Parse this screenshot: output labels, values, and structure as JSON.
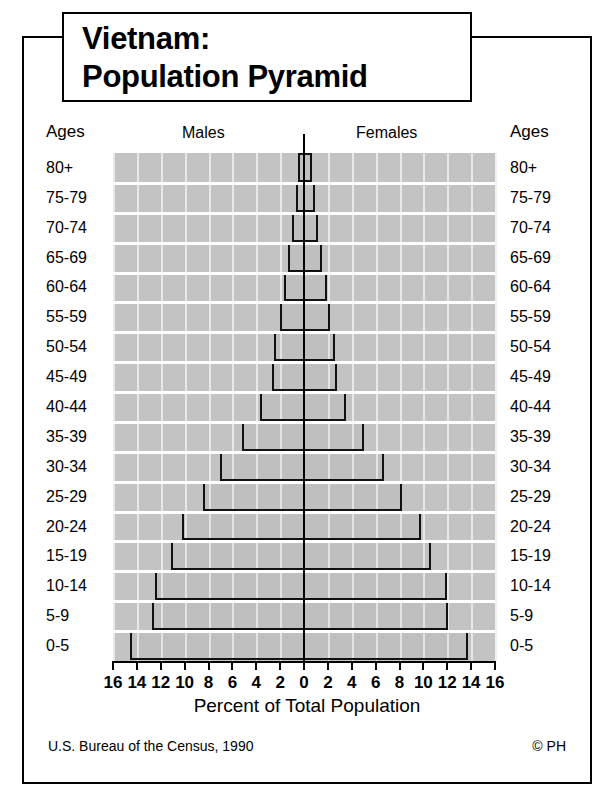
{
  "title": {
    "line1": "Vietnam:",
    "line2": "Population Pyramid"
  },
  "header": {
    "ages_left": "Ages",
    "males": "Males",
    "females": "Females",
    "ages_right": "Ages"
  },
  "footer": {
    "xaxis_title": "Percent of Total Population",
    "source": "U.S. Bureau of the Census, 1990",
    "copyright": "© PH"
  },
  "colors": {
    "plot_background": "#c3c3c3",
    "bar_outline": "#111111",
    "gridline": "#ffffff",
    "text": "#000000"
  },
  "chart_data": {
    "type": "bar",
    "subtype": "population-pyramid",
    "title": "Vietnam: Population Pyramid",
    "xlabel": "Percent of Total Population",
    "ylabel": "Ages",
    "xlim": [
      -16,
      16
    ],
    "xticks": [
      16,
      14,
      12,
      10,
      8,
      6,
      4,
      2,
      0,
      2,
      4,
      6,
      8,
      10,
      12,
      14,
      16
    ],
    "tick_step": 2,
    "grid": true,
    "legend": [
      "Males",
      "Females"
    ],
    "legend_position": "top-inside",
    "orientation": "horizontal",
    "units": "percent of total population",
    "categories": [
      "80+",
      "75-79",
      "70-74",
      "65-69",
      "60-64",
      "55-59",
      "50-54",
      "45-49",
      "40-44",
      "35-39",
      "30-34",
      "25-29",
      "20-24",
      "15-19",
      "10-14",
      "5-9",
      "0-5"
    ],
    "series": [
      {
        "name": "Males",
        "side": "left",
        "values": [
          0.5,
          0.7,
          1.0,
          1.3,
          1.7,
          2.0,
          2.5,
          2.7,
          3.7,
          5.2,
          7.0,
          8.5,
          10.2,
          11.1,
          12.5,
          12.7,
          14.6
        ]
      },
      {
        "name": "Females",
        "side": "right",
        "values": [
          0.7,
          0.9,
          1.2,
          1.5,
          1.9,
          2.2,
          2.6,
          2.8,
          3.5,
          5.0,
          6.7,
          8.2,
          9.8,
          10.6,
          12.0,
          12.1,
          13.7
        ]
      }
    ],
    "source": "U.S. Bureau of the Census, 1990"
  }
}
